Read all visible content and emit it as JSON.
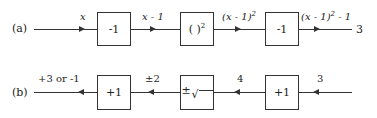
{
  "diagram": {
    "row_a": {
      "label": "(a)",
      "input_label": "x",
      "blocks": [
        {
          "op": "-1"
        },
        {
          "op": "( )",
          "sup": "2"
        },
        {
          "op": "-1"
        }
      ],
      "edges": [
        {
          "label": "x - 1"
        },
        {
          "label": "(x - 1)",
          "sup": "2"
        },
        {
          "label": "(x - 1)",
          "sup": "2",
          "suffix": " - 1"
        }
      ],
      "output_value": "3",
      "direction": "left-to-right"
    },
    "row_b": {
      "label": "(b)",
      "input_label": "3",
      "blocks": [
        {
          "op": "+1"
        },
        {
          "op_pm": "±",
          "op": "√"
        },
        {
          "op": "+1"
        }
      ],
      "edges": [
        {
          "label": "4"
        },
        {
          "label": "±2"
        },
        {
          "label": "+3 or -1"
        }
      ],
      "direction": "right-to-left"
    }
  }
}
